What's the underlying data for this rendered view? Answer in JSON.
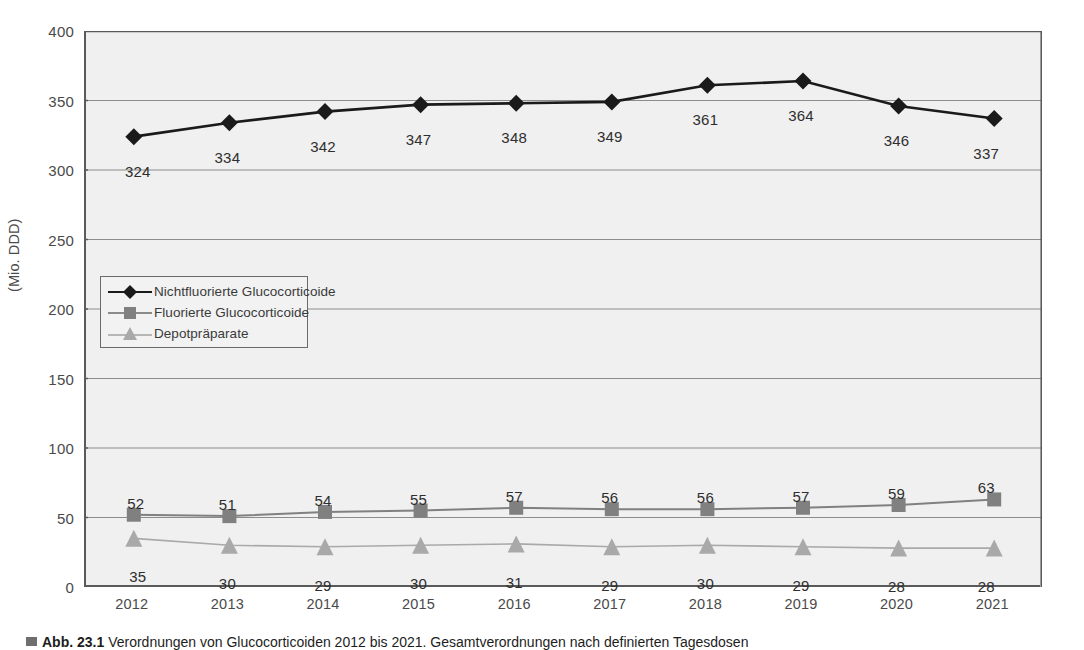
{
  "chart_data": {
    "type": "line",
    "title": "",
    "xlabel": "",
    "ylabel": "(Mio. DDD)",
    "ylim": [
      0,
      400
    ],
    "ytick_values": [
      0,
      50,
      100,
      150,
      200,
      250,
      300,
      350,
      400
    ],
    "ytick_labels": [
      "0",
      "50",
      "100",
      "150",
      "200",
      "250",
      "300",
      "350",
      "400"
    ],
    "grid": "horizontal",
    "legend_position": "inside-left-middle",
    "categories": [
      "2012",
      "2013",
      "2014",
      "2015",
      "2016",
      "2017",
      "2018",
      "2019",
      "2020",
      "2021"
    ],
    "series": [
      {
        "name": "Nichtfluorierte Glucocorticoide",
        "marker": "diamond",
        "color": "#1a1a1a",
        "values": [
          324,
          334,
          342,
          347,
          348,
          349,
          361,
          364,
          346,
          337
        ],
        "labels": [
          "324",
          "334",
          "342",
          "347",
          "348",
          "349",
          "361",
          "364",
          "346",
          "337"
        ]
      },
      {
        "name": "Fluorierte Glucocorticoide",
        "marker": "square",
        "color": "#808080",
        "values": [
          52,
          51,
          54,
          55,
          57,
          56,
          56,
          57,
          59,
          63
        ],
        "labels": [
          "52",
          "51",
          "54",
          "55",
          "57",
          "56",
          "56",
          "57",
          "59",
          "63"
        ]
      },
      {
        "name": "Depotpräparate",
        "marker": "triangle",
        "color": "#a9a9a9",
        "values": [
          35,
          30,
          29,
          30,
          31,
          29,
          30,
          29,
          28,
          28
        ],
        "labels": [
          "35",
          "30",
          "29",
          "30",
          "31",
          "29",
          "30",
          "29",
          "28",
          "28"
        ]
      }
    ]
  },
  "legend": {
    "entries": [
      {
        "label": "Nichtfluorierte Glucocorticoide"
      },
      {
        "label": "Fluorierte Glucocorticoide"
      },
      {
        "label": "Depotpräparate"
      }
    ]
  },
  "caption": {
    "number": "Abb. 23.1",
    "text": "Verordnungen von Glucocorticoiden 2012 bis 2021. Gesamtverordnungen nach definierten Tagesdosen"
  },
  "colors": {
    "plot_background": "#f0f0f0",
    "axis": "#5a5a5a",
    "gridline": "#8c8c8c",
    "series1": "#1a1a1a",
    "series2": "#808080",
    "series3": "#a9a9a9",
    "text": "#3a3a3a"
  }
}
